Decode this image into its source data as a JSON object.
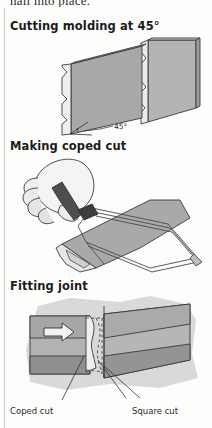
{
  "page": {
    "truncated_top_text": "nail into place.",
    "background_color": "#fdfdfc",
    "rule_color": "#c9c9c9"
  },
  "palette": {
    "molding_face": "#a8a8a8",
    "molding_top": "#c4c4c4",
    "molding_profile": "#efefef",
    "outline": "#3a3a3a",
    "skin": "#f2f2f2",
    "skin_shade": "#cfcfcf",
    "saw_handle": "#4a4a4a",
    "saw_frame": "#9a9a9a",
    "wall_light": "#d6d6d6",
    "wall_mid": "#b0b0b0",
    "wall_dark": "#8f8f8f",
    "dashed": "#4a4a4a"
  },
  "sections": [
    {
      "id": "cutting-molding",
      "heading": "Cutting molding at 45°",
      "annotations": [
        {
          "id": "angle-45",
          "text": "45°"
        }
      ]
    },
    {
      "id": "making-coped-cut",
      "heading": "Making coped cut",
      "annotations": []
    },
    {
      "id": "fitting-joint",
      "heading": "Fitting joint",
      "annotations": [
        {
          "id": "coped-cut-label",
          "text": "Coped cut"
        },
        {
          "id": "square-cut-label",
          "text": "Square cut"
        }
      ]
    }
  ]
}
